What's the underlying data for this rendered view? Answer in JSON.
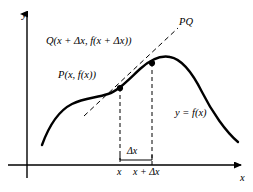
{
  "figure": {
    "background_color": "#ffffff",
    "stroke_color": "#000000",
    "axes": {
      "y_axis_label": "y",
      "x_axis_label": "x",
      "origin": {
        "x": 27,
        "y": 165
      },
      "x_axis_end": {
        "x": 241,
        "y": 165
      },
      "y_axis_top": {
        "x": 27,
        "y": 14
      }
    },
    "labels": {
      "point_q": "Q(x + Δx, f(x + Δx))",
      "point_p": "P(x, f(x))",
      "secant_line": "PQ",
      "curve": "y = f(x)",
      "delta_x": "Δx",
      "tick_x": "x",
      "tick_x_plus_delta": "x + Δx"
    },
    "points": [
      {
        "name": "P",
        "cx": 120,
        "cy": 88
      },
      {
        "name": "Q",
        "cx": 152,
        "cy": 63
      }
    ],
    "drop_lines": [
      {
        "name": "x",
        "x": 120,
        "y_top": 88,
        "y_bottom": 165
      },
      {
        "name": "x-plus-delta-x",
        "x": 152,
        "y_top": 63,
        "y_bottom": 165
      }
    ],
    "delta_brace": {
      "x_left": 120,
      "x_right": 152,
      "y": 160
    },
    "secant": {
      "x1": 84,
      "y1": 116,
      "x2": 178,
      "y2": 28
    },
    "curve_path": "M 42,145 C 50,123 60,110 72,104 C 84,98 96,98 108,94 C 118,91 128,80 140,69 C 150,60 160,55 170,57 C 182,59 192,72 202,92 C 212,112 226,132 238,142"
  }
}
